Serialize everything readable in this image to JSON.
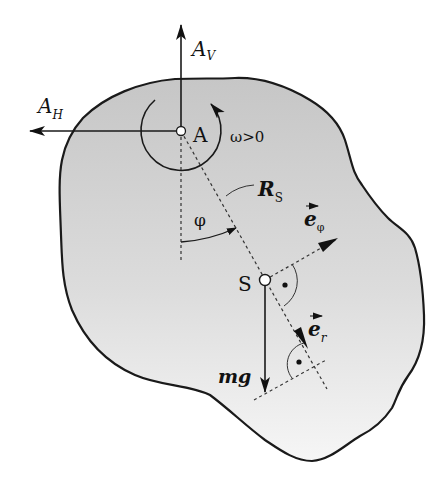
{
  "diagram": {
    "colors": {
      "body_fill_top": "#c9c9c9",
      "body_fill_bottom": "#f4f4f4",
      "stroke": "#1a1a1a",
      "background": "#ffffff"
    },
    "labels": {
      "A_V_main": "A",
      "A_V_sub": "V",
      "A_H_main": "A",
      "A_H_sub": "H",
      "pivot": "A",
      "omega": "ω>0",
      "R_main": "R",
      "R_sub": "S",
      "phi": "φ",
      "e_phi_main": "e",
      "e_phi_sub": "φ",
      "e_r_main": "e",
      "e_r_sub": "r",
      "center_of_mass": "S",
      "weight": "mg"
    }
  }
}
